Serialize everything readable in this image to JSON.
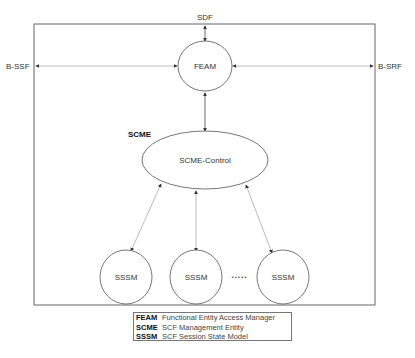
{
  "diagram": {
    "external_labels": {
      "top": "SDF",
      "left": "B-SSF",
      "right": "B-SRF"
    },
    "nodes": {
      "feam": "FEAM",
      "scme_group": "SCME",
      "scme_control": "SCME-Control",
      "sssm": [
        "SSSM",
        "SSSM",
        "SSSM"
      ],
      "ellipsis": "• • • • •"
    },
    "legend": [
      {
        "abbr": "FEAM",
        "text": "Functional Entity Access Manager"
      },
      {
        "abbr": "SCME",
        "text": "SCF Management Entity"
      },
      {
        "abbr": "SSSM",
        "text": "SCF Session State Model"
      }
    ],
    "colors": {
      "line": "#555555",
      "arrow_line": "#999999",
      "text": "#333333"
    }
  }
}
